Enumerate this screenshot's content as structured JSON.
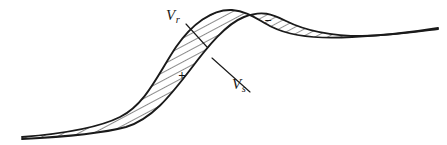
{
  "figure": {
    "background_color": "#ffffff",
    "ink_color": "#1a1a1a",
    "width": 447,
    "height": 145,
    "labels": {
      "vr": {
        "base": "V",
        "subscript": "r",
        "text": "Vr"
      },
      "vs": {
        "base": "V",
        "subscript": "s",
        "text": "Vs"
      }
    },
    "region_signs": {
      "positive": "+",
      "negative": "−"
    }
  },
  "chart_data": {
    "type": "line",
    "title": "",
    "xlabel": "",
    "ylabel": "",
    "grid": false,
    "legend": "inline-annotations",
    "xlim": [
      0,
      447
    ],
    "ylim": [
      145,
      0
    ],
    "annotations": [
      {
        "text": "Vr",
        "x": 178,
        "y": 16,
        "points_to_x": 207,
        "points_to_y": 47
      },
      {
        "text": "Vs",
        "x": 242,
        "y": 84,
        "points_to_x": 212,
        "points_to_y": 58
      },
      {
        "text": "+",
        "x": 182,
        "y": 76
      },
      {
        "text": "−",
        "x": 268,
        "y": 22
      }
    ],
    "series": [
      {
        "name": "Vr",
        "description": "Upper-left sigmoid curve, reference profile",
        "path": "M 22,137 C 60,134 96,129 120,117 C 146,104 158,74 176,47 C 192,24 212,9 232,10 C 248,11 258,20 272,27 C 292,37 320,39 352,37 C 390,35 420,31 438,28"
      },
      {
        "name": "Vs",
        "description": "Lower-right sigmoid curve, shifted profile",
        "path": "M 22,139 C 62,137 100,134 126,127 C 152,119 170,96 190,70 C 208,46 226,24 244,17 C 262,10 272,14 286,21 C 306,31 332,36 362,36 C 398,35 422,31 438,29"
      }
    ],
    "shaded_regions": [
      {
        "name": "positive-lobe",
        "sign": "+",
        "description": "Large hatched lens between Vr and Vs on the rising limb"
      },
      {
        "name": "negative-lobe",
        "sign": "−",
        "description": "Hatched lens between Vs and Vr after the crossover near the peak"
      }
    ],
    "crossings": [
      {
        "x": 22,
        "y": 138
      },
      {
        "x": 245,
        "y": 16
      },
      {
        "x": 438,
        "y": 28
      }
    ]
  }
}
